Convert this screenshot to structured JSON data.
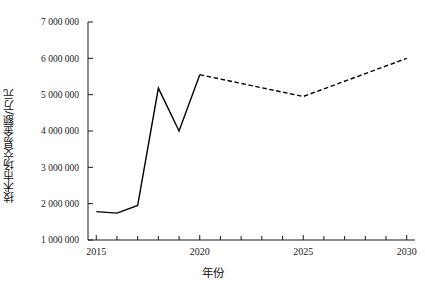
{
  "chart_data": {
    "type": "line",
    "title": "",
    "xlabel": "年份",
    "ylabel": "技术市场交易金额/万元",
    "xlim": [
      2014.6,
      2030.4
    ],
    "ylim": [
      1000000,
      7000000
    ],
    "grid": false,
    "legend": "none",
    "x_ticks_major": [
      2015,
      2020,
      2025,
      2030
    ],
    "x_tick_labels": [
      "2015",
      "2020",
      "2025",
      "2030"
    ],
    "x_ticks_minor": [
      2016,
      2017,
      2018,
      2019,
      2021,
      2022,
      2023,
      2024,
      2026,
      2027,
      2028,
      2029
    ],
    "y_ticks": [
      1000000,
      2000000,
      3000000,
      4000000,
      5000000,
      6000000,
      7000000
    ],
    "y_tick_labels": [
      "1 000 000",
      "2 000 000",
      "3 000 000",
      "4 000 000",
      "5 000 000",
      "6 000 000",
      "7 000 000"
    ],
    "series": [
      {
        "name": "历史值",
        "style": "solid",
        "color": "#000000",
        "x": [
          2015,
          2016,
          2017,
          2018,
          2019,
          2020
        ],
        "values": [
          1780000,
          1740000,
          1950000,
          5180000,
          4000000,
          5550000
        ]
      },
      {
        "name": "预测值",
        "style": "dashed",
        "color": "#000000",
        "x": [
          2020,
          2025,
          2030
        ],
        "values": [
          5550000,
          4950000,
          6000000
        ]
      }
    ]
  },
  "axes": {
    "y_title": "技术市场交易金额/万元",
    "x_title": "年份"
  }
}
